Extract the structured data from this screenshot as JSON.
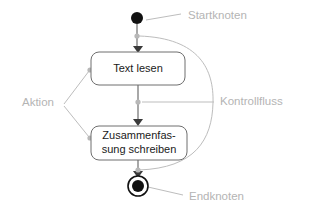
{
  "diagram": {
    "type": "uml-activity-diagram",
    "colors": {
      "node_stroke": "#6e6e6e",
      "node_fill": "#ffffff",
      "node_text": "#1a1a1a",
      "annotation_text": "#b4b4b4",
      "annotation_line": "#bdbdbd",
      "flow_line": "#6e6e6e",
      "marker_fill": "#111111",
      "background": "#ffffff"
    },
    "nodes": {
      "start": {
        "name": "start-node",
        "shape": "filled-circle",
        "cx": 137,
        "cy": 18,
        "r": 6
      },
      "action_1": {
        "name": "action-text-lesen",
        "shape": "rounded-rectangle",
        "x": 91,
        "y": 52,
        "w": 94,
        "h": 33,
        "rx": 8,
        "lines": [
          "Text lesen"
        ]
      },
      "action_2": {
        "name": "action-zusammenfassung-schreiben",
        "shape": "rounded-rectangle",
        "x": 91,
        "y": 126,
        "w": 96,
        "h": 34,
        "rx": 8,
        "lines": [
          "Zusammenfas-",
          "sung schreiben"
        ]
      },
      "end": {
        "name": "end-node",
        "shape": "ringed-filled-circle",
        "cx": 138,
        "cy": 186,
        "r_outer": 10,
        "r_inner": 6
      }
    },
    "annotations": [
      {
        "key": "startknoten",
        "label": "Startknoten",
        "text_x": 188,
        "text_y": 16,
        "leader": "M 181 14 L 146 20",
        "dot_cx": null,
        "dot_cy": null
      },
      {
        "key": "kontrollfluss",
        "label": "Kontrollfluss",
        "text_x": 220,
        "text_y": 102,
        "leader": "M 214 102 L 142 102",
        "dot_cx": 138,
        "dot_cy": 102
      },
      {
        "key": "aktion",
        "label": "Aktion",
        "text_x": 22,
        "text_y": 103,
        "leader_a": "M 64 104 L 89 71",
        "leader_b": "M 64 106 L 89 137",
        "dot_a_cx": 90,
        "dot_a_cy": 70,
        "dot_b_cx": 90,
        "dot_b_cy": 138
      },
      {
        "key": "endknoten",
        "label": "Endknoten",
        "text_x": 189,
        "text_y": 197,
        "leader": "M 183 195 L 148 187",
        "dot_cx": null,
        "dot_cy": null
      }
    ],
    "flows": [
      {
        "key": "start-to-action1",
        "name": "control-flow-start-to-read",
        "path": "M 137 24 L 137 48",
        "dot_cx": 137,
        "dot_cy": 36
      },
      {
        "key": "action1-to-action2",
        "name": "control-flow-read-to-write",
        "path": "M 138 85 L 138 122",
        "dot_cx": 138,
        "dot_cy": 102
      },
      {
        "key": "action2-to-end",
        "name": "control-flow-write-to-end",
        "path": "M 138 160 L 138 174",
        "dot_cx": 138,
        "dot_cy": 170
      }
    ],
    "curve": {
      "name": "kontrollfluss-bracket-curve",
      "path": "M 139 36 C 200 38 214 70 213 103 C 212 140 195 168 139 170"
    }
  }
}
